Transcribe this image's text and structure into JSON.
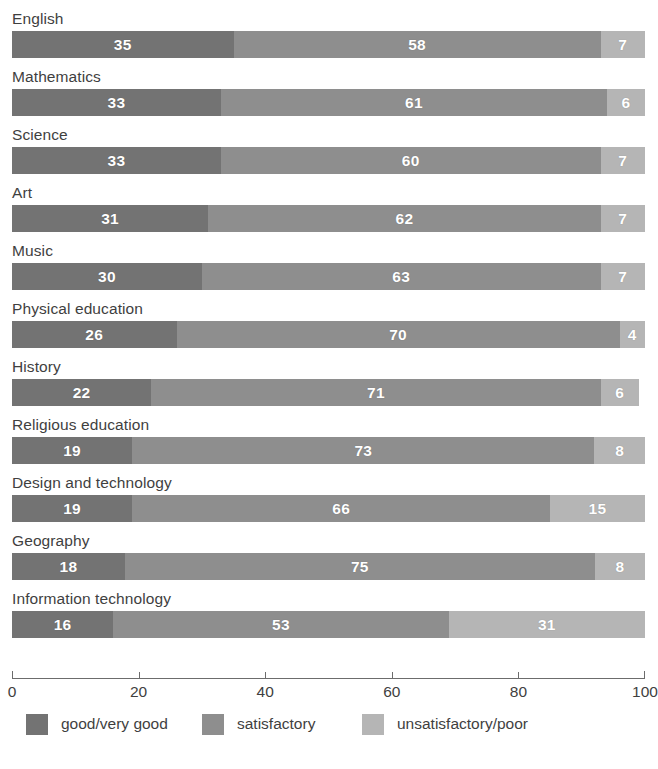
{
  "chart_data": {
    "type": "bar",
    "orientation": "horizontal",
    "stacked": true,
    "title": "",
    "subtitle": "",
    "xlabel": "",
    "ylabel": "",
    "xlim": [
      0,
      100
    ],
    "xticks": [
      0,
      20,
      40,
      60,
      80,
      100
    ],
    "xtick_labels": [
      "0",
      "20",
      "40",
      "60",
      "80",
      "100"
    ],
    "grid": false,
    "legend_position": "bottom-left",
    "categories": [
      "English",
      "Mathematics",
      "Science",
      "Art",
      "Music",
      "Physical education",
      "History",
      "Religious education",
      "Design and technology",
      "Geography",
      "Information technology"
    ],
    "series": [
      {
        "name": "good/very good",
        "color": "#737373",
        "values": [
          35,
          33,
          33,
          31,
          30,
          26,
          22,
          19,
          19,
          18,
          16
        ]
      },
      {
        "name": "satisfactory",
        "color": "#8e8e8e",
        "values": [
          58,
          61,
          60,
          62,
          63,
          70,
          71,
          73,
          66,
          75,
          53
        ]
      },
      {
        "name": "unsatisfactory/poor",
        "color": "#b5b5b5",
        "values": [
          7,
          6,
          7,
          7,
          7,
          4,
          6,
          8,
          15,
          8,
          31
        ]
      }
    ]
  },
  "legend": {
    "items": [
      {
        "label": "good/very good",
        "color": "#737373",
        "left": 14
      },
      {
        "label": "satisfactory",
        "color": "#8e8e8e",
        "left": 190
      },
      {
        "label": "unsatisfactory/poor",
        "color": "#b5b5b5",
        "left": 350
      }
    ]
  },
  "axis": {
    "line_color": "#6c6c6c",
    "ticks": [
      {
        "value": 0,
        "label": "0"
      },
      {
        "value": 20,
        "label": "20"
      },
      {
        "value": 40,
        "label": "40"
      },
      {
        "value": 60,
        "label": "60"
      },
      {
        "value": 80,
        "label": "80"
      },
      {
        "value": 100,
        "label": "100"
      }
    ]
  }
}
